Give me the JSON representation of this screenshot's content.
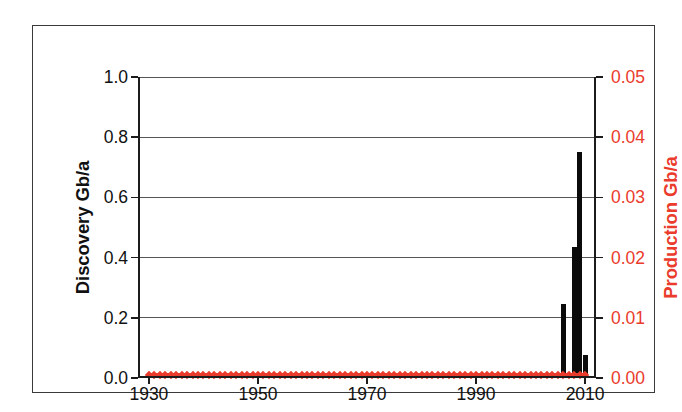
{
  "chart_data": {
    "type": "bar",
    "title": "",
    "xlabel": "",
    "ylabel": "Discovery Gb/a",
    "y2label": "Production Gb/a",
    "xlim": [
      1928,
      2012
    ],
    "ylim": [
      0.0,
      1.0
    ],
    "y2lim": [
      0.0,
      0.05
    ],
    "grid": true,
    "legend": "none",
    "x_ticks": [
      1930,
      1950,
      1970,
      1990,
      2010
    ],
    "x_tick_labels": [
      "1930",
      "1950",
      "1970",
      "1990",
      "2010"
    ],
    "y_ticks": [
      0.0,
      0.2,
      0.4,
      0.6,
      0.8,
      1.0
    ],
    "y_tick_labels": [
      "0.0",
      "0.2",
      "0.4",
      "0.6",
      "0.8",
      "1.0"
    ],
    "y2_ticks": [
      0.0,
      0.01,
      0.02,
      0.03,
      0.04,
      0.05
    ],
    "y2_tick_labels": [
      "0.00",
      "0.01",
      "0.02",
      "0.03",
      "0.04",
      "0.05"
    ],
    "series": [
      {
        "name": "Discovery Gb/a",
        "type": "bar",
        "color": "#0b0b0b",
        "axis": "left",
        "x": [
          2006,
          2008,
          2009,
          2010
        ],
        "values": [
          0.24,
          0.43,
          0.745,
          0.07
        ]
      },
      {
        "name": "Production Gb/a",
        "type": "line",
        "color": "#EA3B2C",
        "axis": "right",
        "x_start": 1930,
        "x_end": 2010,
        "values_constant": 0.0
      }
    ]
  },
  "axes": {
    "left_title": "Discovery Gb/a",
    "right_title": "Production Gb/a",
    "left_tick_labels": [
      "0.0",
      "0.2",
      "0.4",
      "0.6",
      "0.8",
      "1.0"
    ],
    "right_tick_labels": [
      "0.00",
      "0.01",
      "0.02",
      "0.03",
      "0.04",
      "0.05"
    ],
    "x_tick_labels": [
      "1930",
      "1950",
      "1970",
      "1990",
      "2010"
    ]
  },
  "colors": {
    "discovery": "#0b0b0b",
    "production": "#EA3B2C",
    "axis": "#1c1c1c",
    "grid": "#555555",
    "background": "#ffffff"
  }
}
